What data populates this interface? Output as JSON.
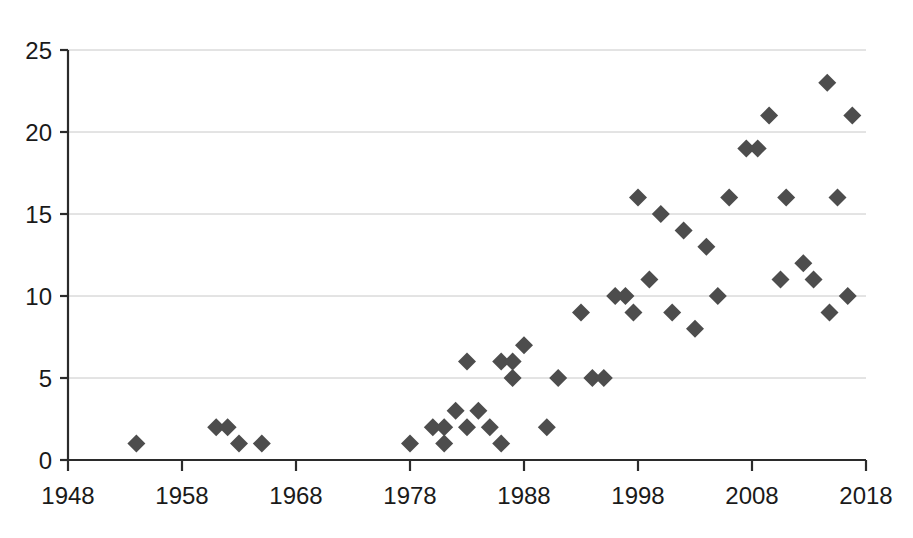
{
  "chart_data": {
    "type": "scatter",
    "title": "",
    "subtitle": "",
    "xlabel": "",
    "ylabel": "",
    "xlim": [
      1948,
      2018
    ],
    "ylim": [
      0,
      25
    ],
    "grid": true,
    "legend": null,
    "marker": {
      "shape": "diamond",
      "color": "#4d4d4d",
      "size": 17
    },
    "axis_color": "#2b2b2b",
    "gridline_color": "#c8c8c8",
    "background_color": "#ffffff",
    "xticks": [
      1948,
      1958,
      1968,
      1978,
      1988,
      1998,
      2008,
      2018
    ],
    "xtick_labels": [
      "1948",
      "1958",
      "1968",
      "1978",
      "1988",
      "1998",
      "2008",
      "2018"
    ],
    "yticks": [
      0,
      5,
      10,
      15,
      20,
      25
    ],
    "ytick_labels": [
      "0",
      "5",
      "10",
      "15",
      "20",
      "25"
    ],
    "x": [
      1954,
      1961,
      1962,
      1963,
      1965,
      1978,
      1980,
      1981,
      1981,
      1982,
      1983,
      1983,
      1984,
      1985,
      1986,
      1986,
      1987,
      1987,
      1988,
      1990,
      1991,
      1993,
      1994,
      1995,
      1996,
      1996,
      1997,
      1998,
      1999,
      2000,
      2001,
      2002,
      2003,
      2004,
      2005,
      2006,
      2007,
      2008,
      2009,
      2010,
      2011,
      2012,
      2013,
      2014,
      2015,
      2016
    ],
    "y": [
      1,
      2,
      2,
      1,
      1,
      1,
      2,
      2,
      1,
      3,
      2,
      6,
      3,
      2,
      6,
      1,
      6,
      5,
      7,
      2,
      5,
      9,
      5,
      5,
      10,
      10,
      9,
      16,
      11,
      15,
      9,
      14,
      8,
      13,
      10,
      16,
      19,
      19,
      21,
      11,
      16,
      12,
      11,
      9,
      23,
      16
    ],
    "points": [
      {
        "x": 1954,
        "y": 1
      },
      {
        "x": 1961,
        "y": 2
      },
      {
        "x": 1962,
        "y": 2
      },
      {
        "x": 1963,
        "y": 1
      },
      {
        "x": 1965,
        "y": 1
      },
      {
        "x": 1978,
        "y": 1
      },
      {
        "x": 1980,
        "y": 2
      },
      {
        "x": 1981,
        "y": 2
      },
      {
        "x": 1981,
        "y": 1
      },
      {
        "x": 1982,
        "y": 3
      },
      {
        "x": 1983,
        "y": 2
      },
      {
        "x": 1983,
        "y": 6
      },
      {
        "x": 1984,
        "y": 3
      },
      {
        "x": 1985,
        "y": 2
      },
      {
        "x": 1986,
        "y": 6
      },
      {
        "x": 1986,
        "y": 1
      },
      {
        "x": 1987,
        "y": 6
      },
      {
        "x": 1987,
        "y": 5
      },
      {
        "x": 1988,
        "y": 7
      },
      {
        "x": 1990,
        "y": 2
      },
      {
        "x": 1991,
        "y": 5
      },
      {
        "x": 1993,
        "y": 9
      },
      {
        "x": 1994,
        "y": 5
      },
      {
        "x": 1995,
        "y": 5
      },
      {
        "x": 1996,
        "y": 10
      },
      {
        "x": 1996.9,
        "y": 10
      },
      {
        "x": 1997.6,
        "y": 9
      },
      {
        "x": 1998,
        "y": 16
      },
      {
        "x": 1999,
        "y": 11
      },
      {
        "x": 2000,
        "y": 15
      },
      {
        "x": 2001,
        "y": 9
      },
      {
        "x": 2002,
        "y": 14
      },
      {
        "x": 2003,
        "y": 8
      },
      {
        "x": 2004,
        "y": 13
      },
      {
        "x": 2005,
        "y": 10
      },
      {
        "x": 2006,
        "y": 16
      },
      {
        "x": 2007.5,
        "y": 19
      },
      {
        "x": 2008.5,
        "y": 19
      },
      {
        "x": 2009.5,
        "y": 21
      },
      {
        "x": 2010.5,
        "y": 11
      },
      {
        "x": 2011,
        "y": 16
      },
      {
        "x": 2012.5,
        "y": 12
      },
      {
        "x": 2013.4,
        "y": 11
      },
      {
        "x": 2014.8,
        "y": 9
      },
      {
        "x": 2014.6,
        "y": 23
      },
      {
        "x": 2015.5,
        "y": 16
      },
      {
        "x": 2016.8,
        "y": 21
      },
      {
        "x": 2016.4,
        "y": 10
      }
    ],
    "point_count": 48
  }
}
